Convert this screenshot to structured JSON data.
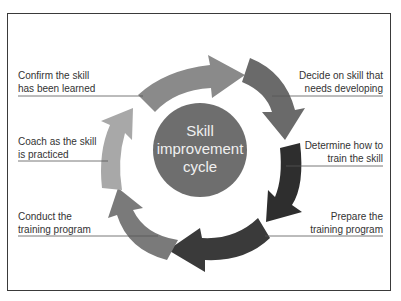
{
  "diagram": {
    "center": {
      "line1": "Skill",
      "line2": "improvement",
      "line3": "cycle",
      "color": "#6e6e6e"
    },
    "steps": [
      {
        "id": "decide",
        "line1": "Decide on skill that",
        "line2": "needs developing",
        "color": "#6a6a6a"
      },
      {
        "id": "determine",
        "line1": "Determine how to",
        "line2": "train the skill",
        "color": "#2e2e2e"
      },
      {
        "id": "prepare",
        "line1": "Prepare the",
        "line2": "training program",
        "color": "#3a3a3a"
      },
      {
        "id": "conduct",
        "line1": "Conduct the",
        "line2": "training program",
        "color": "#7a7a7a"
      },
      {
        "id": "coach",
        "line1": "Coach as the skill",
        "line2": "is practiced",
        "color": "#a8a8a8"
      },
      {
        "id": "confirm",
        "line1": "Confirm the skill",
        "line2": "has been learned",
        "color": "#8a8a8a"
      }
    ],
    "frame_color": "#3a3a3a",
    "leader_line_color": "#555555"
  }
}
